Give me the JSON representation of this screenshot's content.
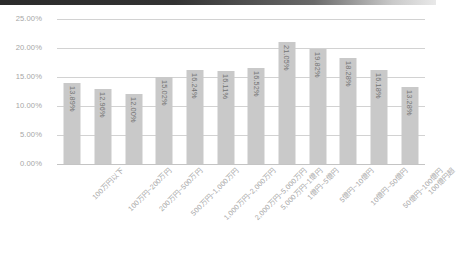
{
  "chart_data": {
    "type": "bar",
    "title": "",
    "subtitle": "",
    "xlabel": "",
    "ylabel": "",
    "ylim": [
      0,
      25
    ],
    "ytick_labels": [
      "0.00%",
      "5.00%",
      "10.00%",
      "15.00%",
      "20.00%",
      "25.00%"
    ],
    "ytick_values": [
      0,
      5,
      10,
      15,
      20,
      25
    ],
    "grid": true,
    "legend": false,
    "legend_position": "none",
    "bar_color": "#c9c9c9",
    "gridline_color": "#d2d2d2",
    "label_color": "#a9a9a9",
    "datalabel_color": "#737373",
    "categories": [
      "100万円以下",
      "100万円~200万円",
      "200万円~500万円",
      "500万円~1,000万円",
      "1,000万円~2,000万円",
      "2,000万円~5,000万円",
      "5,000万円~1億円",
      "1億円~5億円",
      "5億円~10億円",
      "10億円~50億円",
      "50億円~100億円",
      "100億円超"
    ],
    "values": [
      13.89,
      12.96,
      12.0,
      15.02,
      16.24,
      16.11,
      16.52,
      21.05,
      19.82,
      18.28,
      16.18,
      13.28
    ],
    "data_labels": [
      "13.89%",
      "12.96%",
      "12.00%",
      "15.02%",
      "16.24%",
      "16.11%",
      "16.52%",
      "21.05%",
      "19.82%",
      "18.28%",
      "16.18%",
      "13.28%"
    ]
  }
}
